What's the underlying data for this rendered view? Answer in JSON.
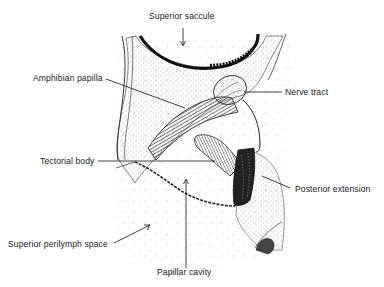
{
  "figure": {
    "labels": {
      "superior_saccule": "Superior saccule",
      "amphibian_papilla": "Amphibian papilla",
      "nerve_tract": "Nerve tract",
      "tectorial_body": "Tectorial body",
      "posterior_extension": "Posterior extension",
      "superior_perilymph_space": "Superior perilymph space",
      "papillar_cavity": "Papillar cavity"
    },
    "colors": {
      "ink": "#1a1a1a",
      "background": "#ffffff",
      "stipple": "#8a8a8a"
    }
  }
}
